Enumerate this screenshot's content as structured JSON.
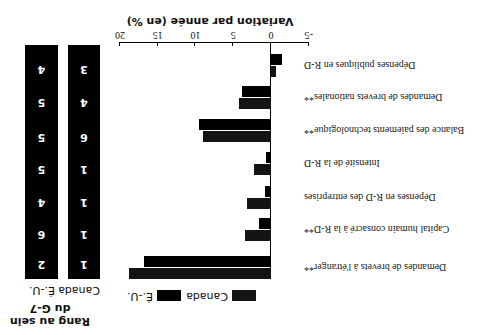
{
  "chart_data": {
    "type": "bar",
    "orientation": "horizontal",
    "rotation_deg": 180,
    "title": "Variation par année (en %)",
    "xlabel": "Variation par année (en %)",
    "ylabel": "",
    "xlim": [
      -5,
      20
    ],
    "xticks": [
      "-5",
      "0",
      "5",
      "10",
      "15",
      "20"
    ],
    "categories": [
      "Demandes de brevets à l'étranger**",
      "Capital humain consacré à la R-D**",
      "Dépenses en R-D des entreprises",
      "Intensité de la R-D",
      "Balance des paiements technologique**",
      "Demandes de brevets nationales**",
      "Dépenses publiques en R-D"
    ],
    "series": [
      {
        "name": "Canada",
        "values": [
          18.8,
          3.4,
          3.2,
          2.2,
          9.0,
          4.2,
          -0.7
        ]
      },
      {
        "name": "É.-U.",
        "values": [
          16.8,
          1.6,
          0.8,
          0.6,
          9.5,
          3.8,
          -1.5
        ]
      }
    ],
    "legend": [
      "Canada",
      "É.-U."
    ],
    "legend_position": "bottom",
    "grid": false,
    "rank_table": {
      "title": "Rang au sein du G-7",
      "columns": [
        "Canada",
        "É.-U."
      ],
      "canada": [
        "1",
        "1",
        "1",
        "1",
        "6",
        "4",
        "3"
      ],
      "us": [
        "2",
        "6",
        "4",
        "5",
        "5",
        "5",
        "4"
      ]
    }
  },
  "labels": {
    "title": "Variation par année (en %)",
    "rank_title_1": "Rang au sein",
    "rank_title_2": "du G-7",
    "rank_col_canada": "Canada",
    "rank_col_us": "É.-U.",
    "legend_canada": "Canada",
    "legend_us": "É.-U."
  }
}
